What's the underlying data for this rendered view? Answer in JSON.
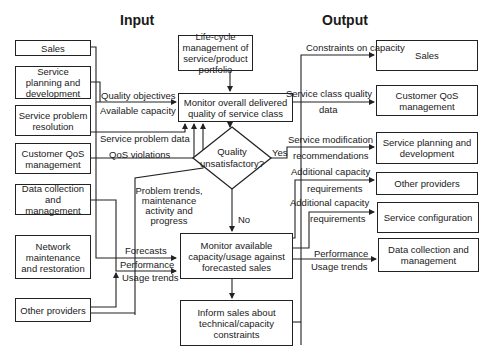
{
  "titles": {
    "input": "Input",
    "output": "Output"
  },
  "inputs": [
    {
      "id": "sales",
      "label": "Sales"
    },
    {
      "id": "service-planning",
      "label": "Service planning and development"
    },
    {
      "id": "service-problem",
      "label": "Service problem resolution"
    },
    {
      "id": "customer-qos",
      "label": "Customer QoS management"
    },
    {
      "id": "data-collection",
      "label": "Data collection and management"
    },
    {
      "id": "network-maintenance",
      "label": "Network maintenance and restoration"
    },
    {
      "id": "other-providers",
      "label": "Other providers"
    }
  ],
  "process": {
    "lifecycle": "Life-cycle management of service/product portfolio",
    "monitor_quality": "Monitor overall delivered quality of service class",
    "decision": "Quality unsatisfactory?",
    "yes": "Yes",
    "no": "No",
    "monitor_capacity": "Monitor available capacity/usage against forecasted sales",
    "inform_sales": "Inform sales about technical/capacity constraints"
  },
  "outputs": [
    {
      "id": "sales",
      "label": "Sales"
    },
    {
      "id": "customer-qos",
      "label": "Customer QoS management"
    },
    {
      "id": "service-planning",
      "label": "Service planning and development"
    },
    {
      "id": "other-providers",
      "label": "Other providers"
    },
    {
      "id": "service-configuration",
      "label": "Service configuration"
    },
    {
      "id": "data-collection",
      "label": "Data collection and management"
    }
  ],
  "flow_labels": {
    "quality_objectives": "Quality objectives",
    "available_capacity": "Available capacity",
    "service_problem_data": "Service problem data",
    "qos_violations": "QoS violations",
    "problem_trends": "Problem trends, maintenance activity and progress",
    "forecasts": "Forecasts",
    "performance_in": "Performance",
    "usage_trends_in": "Usage trends",
    "constraints_on_capacity": "Constraints on capacity",
    "service_class_quality_data_1": "Service class quality",
    "service_class_quality_data_2": "data",
    "service_modification_1": "Service modification",
    "service_modification_2": "recommendations",
    "additional_capacity_a1": "Additional capacity",
    "additional_capacity_a2": "requirements",
    "additional_capacity_b1": "Additional capacity",
    "additional_capacity_b2": "requirements",
    "performance_out": "Performance",
    "usage_trends_out": "Usage trends"
  }
}
